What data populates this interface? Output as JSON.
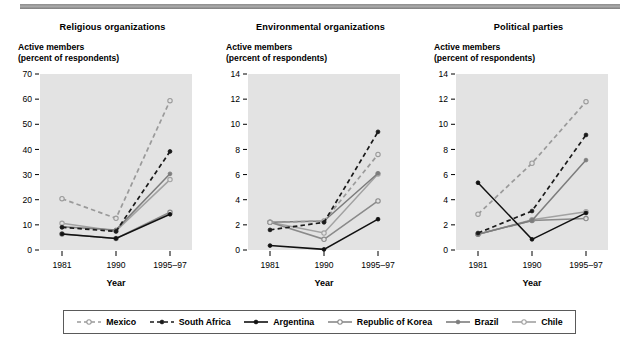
{
  "figure": {
    "axis_caption_line1": "Active members",
    "axis_caption_line2": "(percent of respondents)",
    "xaxis_title": "Year",
    "categories": [
      "1981",
      "1990",
      "1995–97"
    ]
  },
  "legend": {
    "items": [
      {
        "label": "Mexico",
        "key": "mexico",
        "style": "dashed",
        "color": "#9a9a9a",
        "marker": "open"
      },
      {
        "label": "South Africa",
        "key": "south_africa",
        "style": "dashed",
        "color": "#1a1a1a",
        "marker": "filled"
      },
      {
        "label": "Argentina",
        "key": "argentina",
        "style": "solid",
        "color": "#111111",
        "marker": "filled"
      },
      {
        "label": "Republic of Korea",
        "key": "republic_of_korea",
        "style": "solid",
        "color": "#8a8a8a",
        "marker": "open"
      },
      {
        "label": "Brazil",
        "key": "brazil",
        "style": "solid",
        "color": "#7d7d7d",
        "marker": "filled"
      },
      {
        "label": "Chile",
        "key": "chile",
        "style": "solid",
        "color": "#a2a2a2",
        "marker": "open"
      }
    ]
  },
  "chart_data": [
    {
      "type": "line",
      "title": "Religious organizations",
      "xlabel": "Year",
      "ylabel": "Active members (percent of respondents)",
      "x": [
        "1981",
        "1990",
        "1995–97"
      ],
      "ylim": [
        0,
        70
      ],
      "yticks": [
        0,
        10,
        20,
        30,
        40,
        50,
        60,
        70
      ],
      "grid": false,
      "legend_position": "bottom",
      "series": [
        {
          "name": "Mexico",
          "values": [
            20.4,
            12.6,
            59.4
          ]
        },
        {
          "name": "South Africa",
          "values": [
            9.0,
            7.4,
            39.2
          ]
        },
        {
          "name": "Argentina",
          "values": [
            6.4,
            4.6,
            14.2
          ]
        },
        {
          "name": "Republic of Korea",
          "values": [
            6.4,
            4.6,
            15.0
          ]
        },
        {
          "name": "Brazil",
          "values": [
            9.2,
            8.0,
            30.3
          ]
        },
        {
          "name": "Chile",
          "values": [
            10.6,
            7.6,
            28.0
          ]
        }
      ]
    },
    {
      "type": "line",
      "title": "Environmental organizations",
      "xlabel": "Year",
      "ylabel": "Active members (percent of respondents)",
      "x": [
        "1981",
        "1990",
        "1995–97"
      ],
      "ylim": [
        0,
        14
      ],
      "yticks": [
        0,
        2,
        4,
        6,
        8,
        10,
        12,
        14
      ],
      "grid": false,
      "legend_position": "bottom",
      "series": [
        {
          "name": "Mexico",
          "values": [
            2.2,
            2.3,
            7.6
          ]
        },
        {
          "name": "South Africa",
          "values": [
            1.6,
            2.2,
            9.4
          ]
        },
        {
          "name": "Argentina",
          "values": [
            0.35,
            0.05,
            2.45
          ]
        },
        {
          "name": "Republic of Korea",
          "values": [
            2.2,
            0.85,
            3.9
          ]
        },
        {
          "name": "Brazil",
          "values": [
            2.2,
            2.3,
            6.1
          ]
        },
        {
          "name": "Chile",
          "values": [
            2.2,
            1.35,
            6.05
          ]
        }
      ]
    },
    {
      "type": "line",
      "title": "Political parties",
      "xlabel": "Year",
      "ylabel": "Active members (percent of respondents)",
      "x": [
        "1981",
        "1990",
        "1995–97"
      ],
      "ylim": [
        0,
        14
      ],
      "yticks": [
        0,
        2,
        4,
        6,
        8,
        10,
        12,
        14
      ],
      "grid": false,
      "legend_position": "bottom",
      "series": [
        {
          "name": "Mexico",
          "values": [
            2.85,
            6.9,
            11.8
          ]
        },
        {
          "name": "South Africa",
          "values": [
            1.35,
            3.1,
            9.15
          ]
        },
        {
          "name": "Argentina",
          "values": [
            5.35,
            0.85,
            2.95
          ]
        },
        {
          "name": "Republic of Korea",
          "values": [
            1.25,
            2.35,
            2.5
          ]
        },
        {
          "name": "Brazil",
          "values": [
            1.25,
            2.35,
            7.15
          ]
        },
        {
          "name": "Chile",
          "values": [
            1.25,
            2.4,
            3.05
          ]
        }
      ]
    }
  ]
}
